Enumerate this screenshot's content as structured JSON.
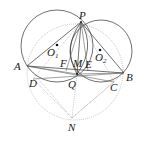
{
  "diagram": {
    "type": "geometry-figure",
    "points": {
      "P": {
        "label": "P",
        "x": 81,
        "y": 22
      },
      "A": {
        "label": "A",
        "x": 27,
        "y": 66
      },
      "B": {
        "label": "B",
        "x": 124,
        "y": 73
      },
      "C": {
        "label": "C",
        "x": 114,
        "y": 82
      },
      "D": {
        "label": "D",
        "x": 33,
        "y": 79
      },
      "F": {
        "label": "F",
        "x": 66,
        "y": 70
      },
      "M": {
        "label": "M",
        "x": 77,
        "y": 70
      },
      "E": {
        "label": "E",
        "x": 87,
        "y": 71
      },
      "Q": {
        "label": "Q",
        "x": 77,
        "y": 74
      },
      "N": {
        "label": "N",
        "x": 72,
        "y": 118
      },
      "O1": {
        "label": "O",
        "sub": "1",
        "x": 57,
        "y": 46
      },
      "O2": {
        "label": "O",
        "sub": "2",
        "x": 100,
        "y": 50
      }
    },
    "circles": [
      {
        "name": "circle-O1",
        "cx": 57,
        "cy": 46,
        "r": 36,
        "style": "solid"
      },
      {
        "name": "circle-O2",
        "cx": 101,
        "cy": 51,
        "r": 31,
        "style": "solid"
      },
      {
        "name": "circumcircle-dotted",
        "cx": 75,
        "cy": 72,
        "r": 48,
        "style": "dotted"
      }
    ],
    "labels": {
      "P": "P",
      "A": "A",
      "B": "B",
      "C": "C",
      "D": "D",
      "F": "F",
      "M": "M",
      "E": "E",
      "Q": "Q",
      "N": "N",
      "O": "O",
      "sub1": "1",
      "sub2": "2"
    }
  }
}
